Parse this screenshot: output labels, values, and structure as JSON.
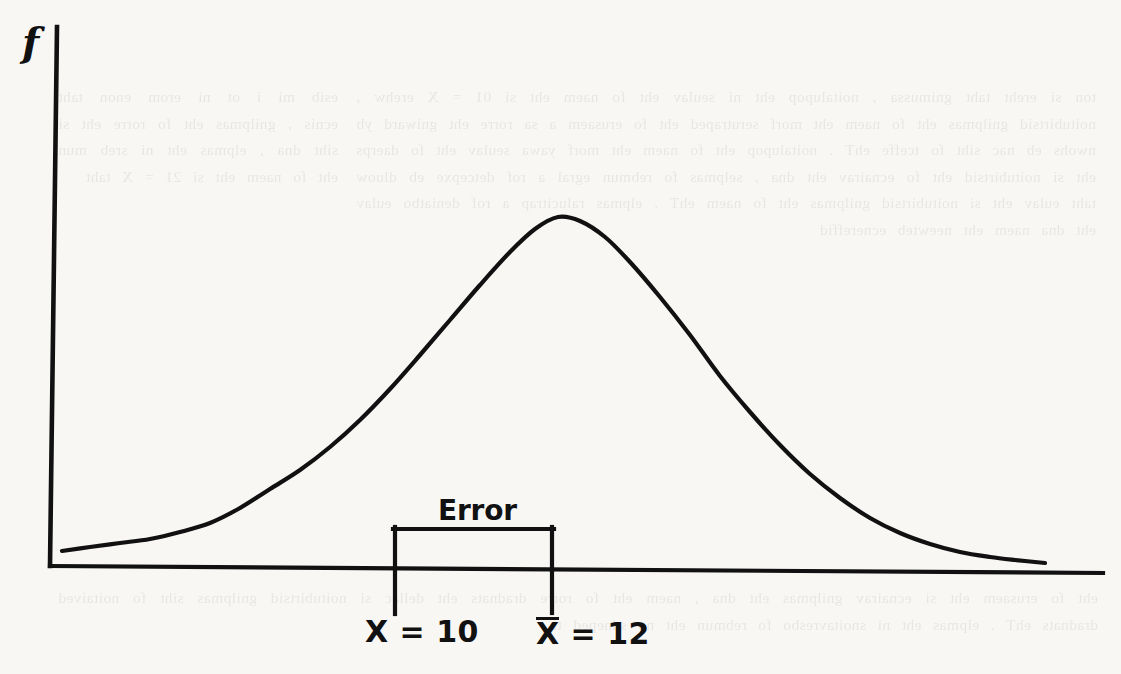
{
  "figure": {
    "axis_label_y": "f",
    "error_label": "Error",
    "tick_label_left": "X = 10",
    "tick_label_right_glyph": "X",
    "tick_label_right_rest": " = 12",
    "tick_label_right_full": "X̅ = 12",
    "ink_color": "#111111",
    "paper_color": "#f8f7f4"
  },
  "ghost_text": {
    "left_column": "esib mi i ot ni erom enon taht ecnis , gnilpmas eht fo rorre eht si siht dna , elpmas eht ni sreb mun eht fo naem eht si 21 = X taht",
    "right_column": "ton si ereht taht gnimussa , noitalupop eht ni seulav eht fo naem eht si 01 = X erehw , noitubirtsid gnilpmas eht fo naem eht morf serutraped eht fo erusaem a sa rorre eht gniward yb nwohs eb nac siht fo tceffe ehT . noitalupop eht fo naem eht morf yawa seulav eht fo daerps eht si noitubirtsid eht fo ecnairav eht dna , selpmas fo rebmun egral a rof detcepxe eb dluow taht eulav eht si noitubirtsid gnilpmas eht fo naem ehT . elpmas ralucitrap a rof deniatbo eulav eht dna naem eht neewteb ecnereffid",
    "bottom_lines": "eht fo erusaem eht si ecnairav gnilpmas eht dna , naem eht fo rorre dradnats eht dellac si noitubirtsid gnilpmas siht fo noitaived dradnats ehT . elpmas eht ni snoitavresbo fo rebmun eht no sdneped ti"
  },
  "chart_data": {
    "type": "line",
    "title": "",
    "xlabel": "",
    "ylabel": "f",
    "grid": false,
    "legend": null,
    "annotations": [
      {
        "name": "error-bracket",
        "label": "Error",
        "from_x": 10,
        "to_x": 12
      },
      {
        "name": "population-mean-tick",
        "label": "X = 10",
        "x": 10
      },
      {
        "name": "sample-mean-tick",
        "label": "X̅ = 12",
        "x": 12
      }
    ],
    "curve": {
      "name": "normal-density",
      "description": "Bell-shaped normal probability density curve",
      "mean_x": 12,
      "points_px": [
        [
          62,
          551
        ],
        [
          90,
          547
        ],
        [
          120,
          543
        ],
        [
          150,
          539
        ],
        [
          180,
          532
        ],
        [
          210,
          523
        ],
        [
          240,
          508
        ],
        [
          270,
          489
        ],
        [
          300,
          470
        ],
        [
          330,
          447
        ],
        [
          360,
          420
        ],
        [
          390,
          389
        ],
        [
          420,
          355
        ],
        [
          450,
          320
        ],
        [
          480,
          285
        ],
        [
          510,
          252
        ],
        [
          535,
          229
        ],
        [
          558,
          217
        ],
        [
          580,
          221
        ],
        [
          605,
          237
        ],
        [
          630,
          262
        ],
        [
          660,
          297
        ],
        [
          690,
          335
        ],
        [
          720,
          376
        ],
        [
          750,
          412
        ],
        [
          780,
          445
        ],
        [
          810,
          474
        ],
        [
          840,
          498
        ],
        [
          870,
          518
        ],
        [
          900,
          533
        ],
        [
          930,
          544
        ],
        [
          960,
          552
        ],
        [
          990,
          557
        ],
        [
          1015,
          560
        ],
        [
          1045,
          563
        ]
      ]
    },
    "axes_px": {
      "y_axis": {
        "x_top": 57,
        "y_top": 27,
        "x_bottom": 50,
        "y_bottom": 566
      },
      "x_axis": {
        "x_left": 50,
        "y_left": 566,
        "x_right": 1103,
        "y_right": 573
      }
    },
    "bracket_px": {
      "left_x": 393,
      "right_x": 552,
      "top_y": 527,
      "bottom_y": 614,
      "axis_y": 567
    }
  }
}
